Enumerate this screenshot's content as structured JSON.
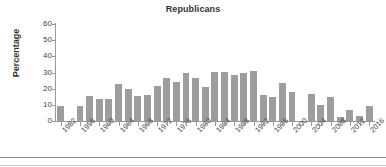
{
  "chart_data": {
    "type": "bar",
    "title": "Republicans",
    "xlabel": "",
    "ylabel": "Percentage",
    "ylim": [
      0,
      60
    ],
    "yticks": [
      0,
      10,
      20,
      30,
      40,
      50,
      60
    ],
    "grid": false,
    "legend": null,
    "bar_color": "#9d9d9d",
    "x_tick_labels": [
      "1952",
      "1956",
      "1960",
      "1964",
      "1968",
      "1972",
      "1976",
      "1980",
      "1984",
      "1988",
      "1992",
      "1996",
      "2000",
      "2004",
      "2008",
      "2012",
      "2016"
    ],
    "x_tick_step_years": 2,
    "categories": [
      1952,
      1954,
      1956,
      1958,
      1960,
      1962,
      1964,
      1966,
      1968,
      1970,
      1972,
      1974,
      1976,
      1978,
      1980,
      1982,
      1984,
      1986,
      1988,
      1990,
      1992,
      1994,
      1996,
      1998,
      2000,
      2002,
      2004,
      2006,
      2008,
      2010,
      2012,
      2014,
      2016
    ],
    "values": [
      9.5,
      null,
      9.5,
      15.3,
      13.5,
      13.6,
      23.0,
      19.8,
      15.6,
      16.3,
      21.5,
      26.5,
      24.0,
      30.0,
      26.3,
      20.8,
      30.1,
      30.1,
      28.6,
      29.9,
      30.8,
      16.3,
      14.6,
      23.8,
      17.7,
      null,
      17.0,
      10.2,
      14.7,
      2.5,
      7.0,
      2.9,
      9.4
    ]
  },
  "axis": {
    "y_tick_labels": [
      "60",
      "50",
      "40",
      "30",
      "20",
      "10",
      "0"
    ]
  }
}
